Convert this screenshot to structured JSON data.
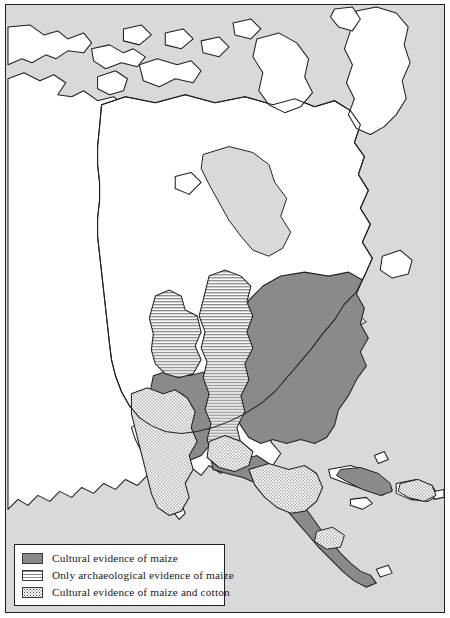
{
  "map": {
    "title": "Distribution of maize and cotton evidence in North America",
    "region": "North America",
    "colors": {
      "ocean": "#d9d9d9",
      "land": "#ffffff",
      "coastline": "#231f20",
      "maize_fill": "#8a8a8a",
      "stripe_fill": "#8a8a8a",
      "stipple_dot": "#4a4a4a",
      "legend_background": "#ffffff",
      "frame": "#231f20"
    }
  },
  "legend": {
    "items": [
      {
        "swatch": "solid-gray-swatch",
        "label": "Cultural evidence of maize"
      },
      {
        "swatch": "striped-swatch",
        "label": "Only archaeological evidence of maize"
      },
      {
        "swatch": "stippled-swatch",
        "label": "Cultural evidence of maize and cotton"
      }
    ]
  }
}
